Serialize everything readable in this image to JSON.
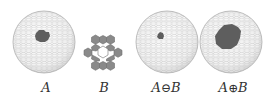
{
  "figure": {
    "panels": [
      {
        "id": "A",
        "type": "sphere",
        "label": "A",
        "cx": 44,
        "cy": 42,
        "r": 31,
        "patch": {
          "cx": 42,
          "cy": 36,
          "r": 7
        }
      },
      {
        "id": "B",
        "type": "structuring-element",
        "label": "B",
        "cx": 103,
        "cy": 55,
        "hex_r": 8
      },
      {
        "id": "erosion",
        "type": "sphere",
        "label_left": "A",
        "label_op": "⊖",
        "label_right": "B",
        "cx": 167,
        "cy": 42,
        "r": 31,
        "patch": {
          "cx": 161,
          "cy": 36,
          "r": 3.5
        }
      },
      {
        "id": "dilation",
        "type": "sphere",
        "label_left": "A",
        "label_op": "⊕",
        "label_right": "B",
        "cx": 231,
        "cy": 42,
        "r": 31,
        "patch": {
          "cx": 228,
          "cy": 37,
          "r": 13
        }
      }
    ],
    "colors": {
      "mesh": "#b8b8b8",
      "sphere_fill": "#f7f7f7",
      "patch": "#5e5e5e",
      "hex_fill": "#8a8a8a",
      "hex_stroke": "#6e6e6e",
      "text": "#333333"
    }
  }
}
